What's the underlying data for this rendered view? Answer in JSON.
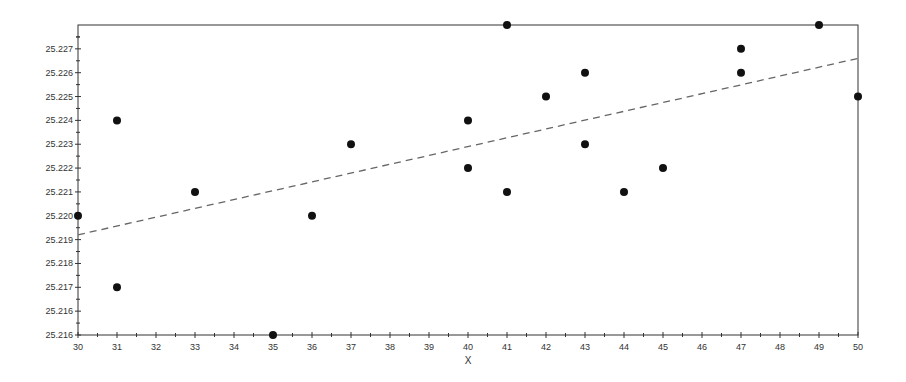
{
  "chart_data": {
    "type": "scatter",
    "title": "",
    "xlabel": "X",
    "ylabel": "",
    "xlim": [
      30,
      50
    ],
    "ylim": [
      25.215,
      25.228
    ],
    "grid": false,
    "legend": null,
    "x_ticks": [
      30,
      31,
      32,
      33,
      34,
      35,
      36,
      37,
      38,
      39,
      40,
      41,
      42,
      43,
      44,
      45,
      46,
      47,
      48,
      49,
      50
    ],
    "y_ticks": [
      {
        "value": 25.215,
        "label": "25.216"
      },
      {
        "value": 25.216,
        "label": "25.216"
      },
      {
        "value": 25.217,
        "label": "25.217"
      },
      {
        "value": 25.218,
        "label": "25.218"
      },
      {
        "value": 25.219,
        "label": "25.219"
      },
      {
        "value": 25.22,
        "label": "25.220"
      },
      {
        "value": 25.221,
        "label": "25.221"
      },
      {
        "value": 25.222,
        "label": "25.222"
      },
      {
        "value": 25.223,
        "label": "25.223"
      },
      {
        "value": 25.224,
        "label": "25.224"
      },
      {
        "value": 25.225,
        "label": "25.225"
      },
      {
        "value": 25.226,
        "label": "25.226"
      },
      {
        "value": 25.227,
        "label": "25.227"
      }
    ],
    "series": [
      {
        "name": "observations",
        "marker": "filled-circle",
        "color": "#111111",
        "points": [
          {
            "x": 30,
            "y": 25.22
          },
          {
            "x": 31,
            "y": 25.224
          },
          {
            "x": 31,
            "y": 25.217
          },
          {
            "x": 33,
            "y": 25.221
          },
          {
            "x": 35,
            "y": 25.215
          },
          {
            "x": 36,
            "y": 25.22
          },
          {
            "x": 37,
            "y": 25.223
          },
          {
            "x": 40,
            "y": 25.224
          },
          {
            "x": 40,
            "y": 25.222
          },
          {
            "x": 41,
            "y": 25.228
          },
          {
            "x": 41,
            "y": 25.221
          },
          {
            "x": 42,
            "y": 25.225
          },
          {
            "x": 43,
            "y": 25.226
          },
          {
            "x": 43,
            "y": 25.223
          },
          {
            "x": 44,
            "y": 25.221
          },
          {
            "x": 45,
            "y": 25.222
          },
          {
            "x": 47,
            "y": 25.227
          },
          {
            "x": 47,
            "y": 25.226
          },
          {
            "x": 49,
            "y": 25.228
          },
          {
            "x": 50,
            "y": 25.225
          }
        ]
      }
    ],
    "trend_line": {
      "name": "regression-fit",
      "style": "dashed",
      "color": "#666666",
      "x_start": 30,
      "y_start": 25.2192,
      "x_end": 50,
      "y_end": 25.2266
    }
  },
  "colors": {
    "frame": "#333333",
    "marker": "#111111",
    "trend": "#666666",
    "text": "#333333"
  }
}
